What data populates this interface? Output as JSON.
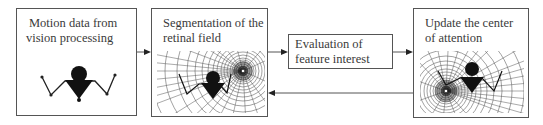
{
  "diagram": {
    "nodes": [
      {
        "id": "motion",
        "lines": [
          "Motion data from",
          "vision processing"
        ],
        "figure": "stick-figure"
      },
      {
        "id": "segmentation",
        "lines": [
          "Segmentation of the",
          "retinal field"
        ],
        "figure": "log-polar-grid-focus-right"
      },
      {
        "id": "evaluation",
        "lines": [
          "Evaluation of",
          "feature interest"
        ]
      },
      {
        "id": "update",
        "lines": [
          "Update the center",
          "of attention"
        ],
        "figure": "log-polar-grid-focus-left"
      }
    ],
    "edges": [
      {
        "from": "motion",
        "to": "segmentation",
        "direction": "forward"
      },
      {
        "from": "segmentation",
        "to": "evaluation",
        "direction": "forward"
      },
      {
        "from": "evaluation",
        "to": "update",
        "direction": "forward"
      },
      {
        "from": "update",
        "to": "segmentation",
        "direction": "feedback"
      }
    ],
    "icons": {
      "arrow": "arrow-right-icon",
      "figure": "stick-figure-icon",
      "grid": "retinal-grid-icon"
    },
    "colors": {
      "line": "#555555",
      "text": "#3a3a3a",
      "figure": "#111111"
    }
  }
}
